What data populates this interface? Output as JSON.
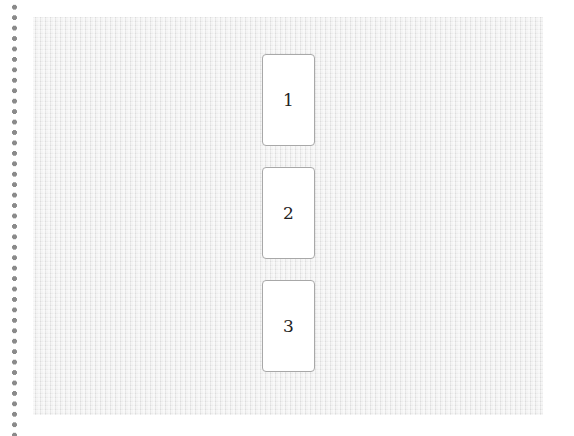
{
  "board": {
    "cards": [
      {
        "label": "1",
        "top": 37
      },
      {
        "label": "2",
        "top": 150
      },
      {
        "label": "3",
        "top": 263
      }
    ]
  },
  "colors": {
    "board_bg": "#ececec",
    "card_bg": "#ffffff",
    "card_border": "#a8a8a8",
    "dots": "#8a8a8a"
  }
}
